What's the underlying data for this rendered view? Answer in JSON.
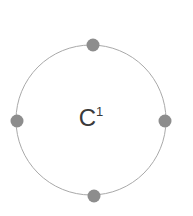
{
  "diagram": {
    "type": "bohr-shell-diagram",
    "background_color": "#ffffff",
    "canvas": {
      "width": 193,
      "height": 216
    },
    "nucleus": {
      "label_symbol": "C",
      "label_superscript": "1",
      "label_full": "C¹",
      "text_color": "#3a3a3a",
      "center_x": 91,
      "center_y": 120
    },
    "shell": {
      "name": "valence-shell-ring",
      "center_x": 91,
      "center_y": 120,
      "radius": 75,
      "stroke_color": "#a9a9a9",
      "stroke_width": 1
    },
    "electrons": [
      {
        "name": "electron-top",
        "position": "top",
        "cx": 93,
        "cy": 45,
        "r": 6.5,
        "color": "#8d8d8d"
      },
      {
        "name": "electron-right",
        "position": "right",
        "cx": 165,
        "cy": 121,
        "r": 6.5,
        "color": "#8d8d8d"
      },
      {
        "name": "electron-bottom",
        "position": "bottom",
        "cx": 94,
        "cy": 196,
        "r": 6.5,
        "color": "#8d8d8d"
      },
      {
        "name": "electron-left",
        "position": "left",
        "cx": 17,
        "cy": 121,
        "r": 6.5,
        "color": "#8d8d8d"
      }
    ],
    "electron_count": 4
  }
}
